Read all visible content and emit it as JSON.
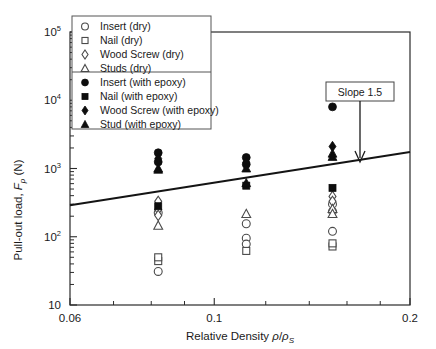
{
  "chart_data": {
    "type": "scatter",
    "title": "",
    "xlabel": "Relative Density  ρ/ρs",
    "ylabel": "Pull-out load,  Fp (N)",
    "xscale": "log",
    "yscale": "log",
    "xlim": [
      0.06,
      0.2
    ],
    "ylim": [
      10,
      100000
    ],
    "xticks": [
      "0.06",
      "0.1",
      "0.2"
    ],
    "xtick_values": [
      0.06,
      0.1,
      0.2
    ],
    "yticks": [
      "10",
      "10^2",
      "10^3",
      "10^4",
      "10^5"
    ],
    "ytick_values": [
      10,
      100,
      1000,
      10000,
      100000
    ],
    "grid": false,
    "legend_position": "top-left-inside",
    "legend_groups": [
      {
        "items": [
          {
            "label": "Insert  (dry)",
            "marker": "open-circle"
          },
          {
            "label": "Nail  (dry)",
            "marker": "open-square"
          },
          {
            "label": "Wood Screw  (dry)",
            "marker": "open-diamond"
          },
          {
            "label": "Studs  (dry)",
            "marker": "open-triangle"
          }
        ]
      },
      {
        "items": [
          {
            "label": "Insert  (with epoxy)",
            "marker": "filled-circle"
          },
          {
            "label": "Nail  (with epoxy)",
            "marker": "filled-square"
          },
          {
            "label": "Wood Screw  (with epoxy)",
            "marker": "filled-diamond"
          },
          {
            "label": "Stud  (with epoxy)",
            "marker": "filled-triangle"
          }
        ]
      }
    ],
    "annotations": [
      {
        "text": "Slope 1.5",
        "type": "boxed-label-with-arrow",
        "points_to": "trend-line"
      }
    ],
    "trend_line": {
      "label": "Slope 1.5",
      "slope": 1.5,
      "x_start": 0.06,
      "y_start": 290,
      "x_end": 0.2,
      "y_end": 1750
    },
    "series": [
      {
        "name": "Insert  (dry)",
        "marker": "open-circle",
        "points": [
          {
            "x": 0.082,
            "y": 31
          },
          {
            "x": 0.082,
            "y": 225
          },
          {
            "x": 0.112,
            "y": 155
          },
          {
            "x": 0.112,
            "y": 95
          },
          {
            "x": 0.112,
            "y": 78
          },
          {
            "x": 0.152,
            "y": 235
          },
          {
            "x": 0.152,
            "y": 300
          },
          {
            "x": 0.152,
            "y": 120
          }
        ]
      },
      {
        "name": "Nail  (dry)",
        "marker": "open-square",
        "points": [
          {
            "x": 0.082,
            "y": 44
          },
          {
            "x": 0.082,
            "y": 50
          },
          {
            "x": 0.112,
            "y": 62
          },
          {
            "x": 0.152,
            "y": 72
          },
          {
            "x": 0.152,
            "y": 80
          }
        ]
      },
      {
        "name": "Wood Screw  (dry)",
        "marker": "open-diamond",
        "points": [
          {
            "x": 0.082,
            "y": 330
          },
          {
            "x": 0.082,
            "y": 250
          },
          {
            "x": 0.082,
            "y": 205
          },
          {
            "x": 0.152,
            "y": 390
          },
          {
            "x": 0.152,
            "y": 330
          }
        ]
      },
      {
        "name": "Studs  (dry)",
        "marker": "open-triangle",
        "points": [
          {
            "x": 0.082,
            "y": 145
          },
          {
            "x": 0.112,
            "y": 215
          },
          {
            "x": 0.152,
            "y": 255
          },
          {
            "x": 0.152,
            "y": 215
          }
        ]
      },
      {
        "name": "Insert  (with epoxy)",
        "marker": "filled-circle",
        "points": [
          {
            "x": 0.082,
            "y": 1700
          },
          {
            "x": 0.082,
            "y": 1250
          },
          {
            "x": 0.112,
            "y": 1450
          },
          {
            "x": 0.112,
            "y": 1150
          },
          {
            "x": 0.152,
            "y": 8000
          }
        ]
      },
      {
        "name": "Nail  (with epoxy)",
        "marker": "filled-square",
        "points": [
          {
            "x": 0.082,
            "y": 280
          },
          {
            "x": 0.112,
            "y": 560
          },
          {
            "x": 0.152,
            "y": 520
          }
        ]
      },
      {
        "name": "Wood Screw  (with epoxy)",
        "marker": "filled-diamond",
        "points": [
          {
            "x": 0.082,
            "y": 1400
          },
          {
            "x": 0.112,
            "y": 1230
          },
          {
            "x": 0.152,
            "y": 2100
          }
        ]
      },
      {
        "name": "Stud  (with epoxy)",
        "marker": "filled-triangle",
        "points": [
          {
            "x": 0.082,
            "y": 1000
          },
          {
            "x": 0.082,
            "y": 960
          },
          {
            "x": 0.112,
            "y": 1000
          },
          {
            "x": 0.112,
            "y": 610
          },
          {
            "x": 0.152,
            "y": 1650
          },
          {
            "x": 0.152,
            "y": 1480
          }
        ]
      }
    ]
  }
}
